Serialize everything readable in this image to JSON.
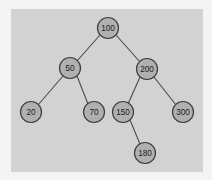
{
  "diagram": {
    "type": "binary-search-tree",
    "panel": {
      "background_color": "#d2d2d2",
      "x": 11,
      "y": 9,
      "width": 192,
      "height": 163
    },
    "canvas_background_color": "#f4f4f4",
    "node_style": {
      "fill_color": "#b0b0b0",
      "stroke_color": "#3d3d3d",
      "label_color": "#1c1c1c",
      "radius": 10
    },
    "edge_style": {
      "stroke_color": "#4a4a4a",
      "stroke_width": 1.1
    },
    "nodes": [
      {
        "id": "n100",
        "label": "100",
        "x": 108,
        "y": 28,
        "r": 10.5
      },
      {
        "id": "n50",
        "label": "50",
        "x": 70,
        "y": 68,
        "r": 10.5
      },
      {
        "id": "n200",
        "label": "200",
        "x": 147,
        "y": 69,
        "r": 10.5
      },
      {
        "id": "n20",
        "label": "20",
        "x": 31,
        "y": 112,
        "r": 10.5
      },
      {
        "id": "n70",
        "label": "70",
        "x": 94,
        "y": 112,
        "r": 10.5
      },
      {
        "id": "n150",
        "label": "150",
        "x": 123,
        "y": 112,
        "r": 10.5
      },
      {
        "id": "n300",
        "label": "300",
        "x": 183,
        "y": 112,
        "r": 10.5
      },
      {
        "id": "n180",
        "label": "180",
        "x": 145,
        "y": 153,
        "r": 10.5
      }
    ],
    "edges": [
      {
        "from": "n100",
        "to": "n50",
        "x1": 100,
        "y1": 35,
        "x2": 77,
        "y2": 61
      },
      {
        "from": "n100",
        "to": "n200",
        "x1": 116,
        "y1": 35,
        "x2": 140,
        "y2": 62
      },
      {
        "from": "n50",
        "to": "n20",
        "x1": 63,
        "y1": 76,
        "x2": 38,
        "y2": 105
      },
      {
        "from": "n50",
        "to": "n70",
        "x1": 77,
        "y1": 76,
        "x2": 88,
        "y2": 104
      },
      {
        "from": "n200",
        "to": "n150",
        "x1": 140,
        "y1": 77,
        "x2": 128,
        "y2": 104
      },
      {
        "from": "n200",
        "to": "n300",
        "x1": 154,
        "y1": 77,
        "x2": 176,
        "y2": 105
      },
      {
        "from": "n150",
        "to": "n180",
        "x1": 130,
        "y1": 120,
        "x2": 140,
        "y2": 144
      }
    ]
  }
}
